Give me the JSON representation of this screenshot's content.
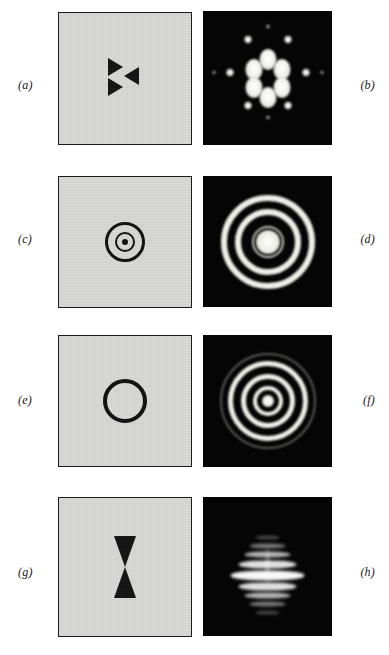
{
  "figure": {
    "page_background": "#ffffff",
    "aperture_fill": "#d9d9d7",
    "aperture_border": "#1b1b1b",
    "diffraction_background": "#050505",
    "diffraction_bright": "#efefe8",
    "panel_count": 8,
    "row_count": 4,
    "rows": [
      {
        "row_index": 1,
        "object": {
          "label": "(a)",
          "label_side": "left",
          "kind": "aperture",
          "shape_name": "three-triangle-pinwheel",
          "description": "Three opaque triangles arranged with threefold symmetry",
          "element_count": 3
        },
        "pattern": {
          "label": "(b)",
          "label_side": "right",
          "kind": "diffraction",
          "shape_name": "sixfold-rosette",
          "description": "Six-lobed central rosette with hexagonal array of satellite spots",
          "petal_count": 6,
          "satellite_ring_counts": [
            6,
            6
          ]
        }
      },
      {
        "row_index": 2,
        "object": {
          "label": "(c)",
          "label_side": "left",
          "kind": "aperture",
          "shape_name": "double-annulus-with-dot",
          "description": "Outer ring, inner ring and central dot",
          "element_count": 3
        },
        "pattern": {
          "label": "(d)",
          "label_side": "right",
          "kind": "diffraction",
          "shape_name": "concentric-rings-wide",
          "description": "Bright central disc surrounded by widely spaced bright rings",
          "ring_count": 3
        }
      },
      {
        "row_index": 3,
        "object": {
          "label": "(e)",
          "label_side": "left",
          "kind": "aperture",
          "shape_name": "single-annulus",
          "description": "One thick opaque circular ring",
          "element_count": 1
        },
        "pattern": {
          "label": "(f)",
          "label_side": "right",
          "kind": "diffraction",
          "shape_name": "concentric-rings-narrow",
          "description": "Bessel-type pattern of many closely spaced bright rings",
          "ring_count": 5
        }
      },
      {
        "row_index": 4,
        "object": {
          "label": "(g)",
          "label_side": "left",
          "kind": "aperture",
          "shape_name": "vertical-bowtie",
          "description": "Two opaque triangles meeting apex to apex, vertically oriented",
          "element_count": 2
        },
        "pattern": {
          "label": "(h)",
          "label_side": "right",
          "kind": "diffraction",
          "shape_name": "horizontal-fringe-bands",
          "description": "Bright horizontal central bar with stacked fringe bands above and below and a narrow vertical waist",
          "band_count": 7
        }
      }
    ]
  }
}
